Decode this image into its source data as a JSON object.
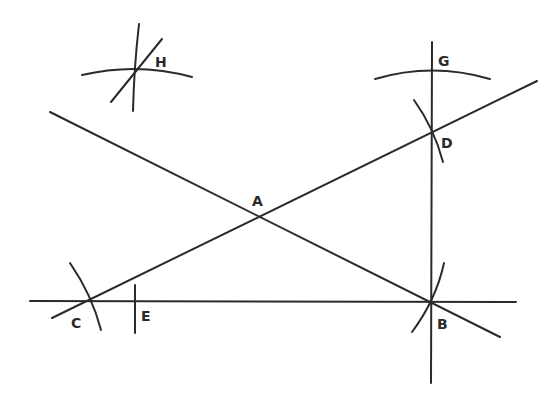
{
  "diagram": {
    "title": "",
    "stroke_color": "#2a2a2a",
    "background": "#ffffff",
    "points": [
      {
        "id": "A",
        "label": "A"
      },
      {
        "id": "B",
        "label": "B"
      },
      {
        "id": "C",
        "label": "C"
      },
      {
        "id": "D",
        "label": "D"
      },
      {
        "id": "E",
        "label": "E"
      },
      {
        "id": "G",
        "label": "G"
      },
      {
        "id": "H",
        "label": "H"
      }
    ],
    "lines": [
      {
        "id": "base-line",
        "through": [
          "C",
          "E",
          "B"
        ]
      },
      {
        "id": "perpendicular-line",
        "through": [
          "G",
          "D",
          "B"
        ]
      },
      {
        "id": "diagonal-line-BA",
        "through": [
          "A",
          "B"
        ]
      },
      {
        "id": "diagonal-line-CD",
        "through": [
          "C",
          "A",
          "D"
        ]
      }
    ],
    "arcs": [
      {
        "id": "arc-at-C"
      },
      {
        "id": "arc-at-B"
      },
      {
        "id": "arc-at-D"
      },
      {
        "id": "arc-at-G"
      },
      {
        "id": "arc-at-H"
      },
      {
        "id": "tick-at-E"
      }
    ]
  }
}
